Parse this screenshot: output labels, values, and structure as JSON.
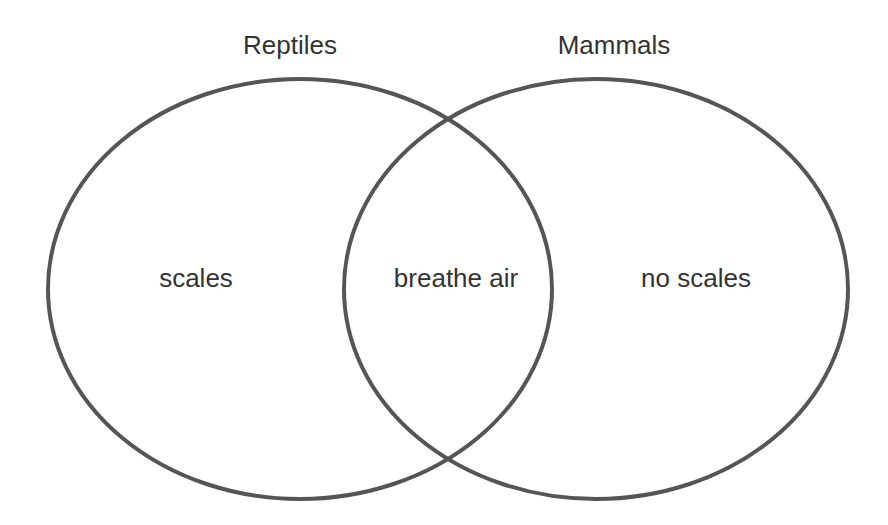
{
  "diagram": {
    "type": "venn",
    "sets": [
      {
        "name": "Reptiles",
        "only_region_label": "scales"
      },
      {
        "name": "Mammals",
        "only_region_label": "no scales"
      }
    ],
    "intersection_label": "breathe air",
    "colors": {
      "stroke": "#555555",
      "text": "#333333",
      "background": "#ffffff"
    }
  }
}
